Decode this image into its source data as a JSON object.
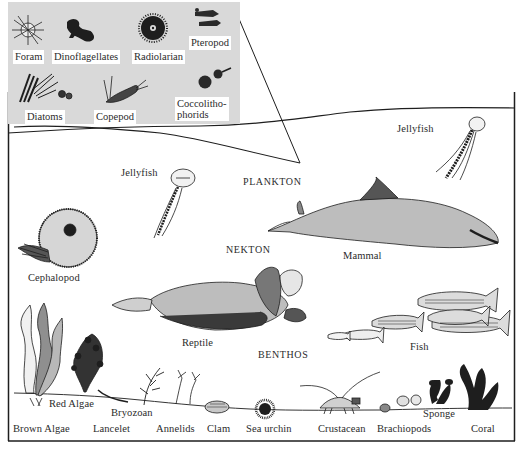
{
  "diagram": {
    "type": "marine-life-zones-illustration",
    "zones": {
      "plankton": "PLANKTON",
      "nekton": "NEKTON",
      "benthos": "BENTHOS"
    },
    "inset": {
      "label": "plankton-magnified-inset",
      "organisms": [
        {
          "label": "Foram"
        },
        {
          "label": "Dinoflagellates"
        },
        {
          "label": "Radiolarian"
        },
        {
          "label": "Pteropod"
        },
        {
          "label": "Diatoms"
        },
        {
          "label": "Copepod"
        },
        {
          "label": "Coccolitho-",
          "label_line2": "phorids"
        }
      ]
    },
    "plankton": [
      {
        "label": "Jellyfish"
      },
      {
        "label": "Jellyfish"
      }
    ],
    "nekton": [
      {
        "label": "Cephalopod"
      },
      {
        "label": "Mammal"
      },
      {
        "label": "Reptile"
      },
      {
        "label": "Fish"
      }
    ],
    "benthos": [
      {
        "label": "Brown Algae"
      },
      {
        "label": "Red Algae"
      },
      {
        "label": "Bryozoan"
      },
      {
        "label": "Lancelet"
      },
      {
        "label": "Annelids"
      },
      {
        "label": "Clam"
      },
      {
        "label": "Sea urchin"
      },
      {
        "label": "Crustacean"
      },
      {
        "label": "Brachiopods"
      },
      {
        "label": "Sponge"
      },
      {
        "label": "Coral"
      }
    ],
    "colors": {
      "ink": "#1e1e1e",
      "inset_background": "#d9d9d9",
      "label_background": "#ffffff",
      "paper": "#ffffff"
    }
  }
}
